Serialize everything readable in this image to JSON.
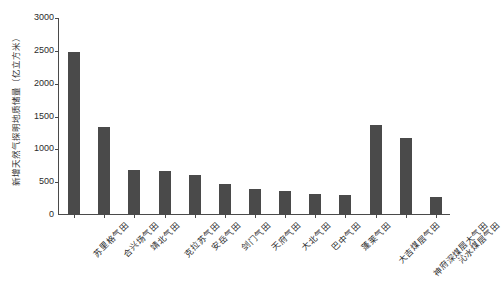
{
  "chart_data": {
    "type": "bar",
    "title": "",
    "xlabel": "",
    "ylabel": "新增天然气探明地质储量（亿立方米）",
    "ylim": [
      0,
      3000
    ],
    "ytick_labels": [
      "3000",
      "2500",
      "2000",
      "1500",
      "1000",
      "500",
      "0"
    ],
    "ytick_values": [
      3000,
      2500,
      2000,
      1500,
      1000,
      500,
      0
    ],
    "grid": false,
    "legend": null,
    "bar_color": "#4a4a4a",
    "axis_color": "#4a4a4a",
    "background_color": "#ffffff",
    "categories": [
      "苏里格气田",
      "合兴场气田",
      "靖北气田",
      "克拉苏气田",
      "安岳气田",
      "剑门气田",
      "天府气田",
      "大北气田",
      "巴中气田",
      "蓬莱气田",
      "大吉煤层气田",
      "神府深煤层大气田",
      "沁水煤层气田"
    ],
    "values": [
      2465,
      1320,
      670,
      655,
      595,
      455,
      380,
      345,
      305,
      290,
      1355,
      1155,
      260
    ]
  }
}
